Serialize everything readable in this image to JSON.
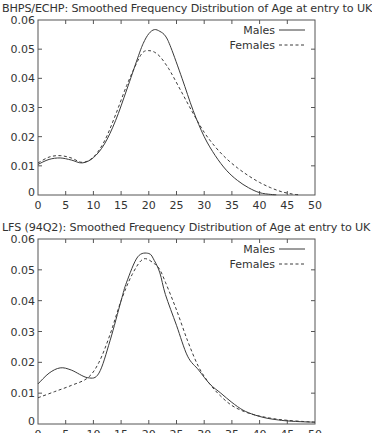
{
  "chart_data": [
    {
      "type": "line",
      "title": "BHPS/ECHP: Smoothed Frequency Distribution of Age at entry to UK",
      "xlabel": "",
      "ylabel": "",
      "xlim": [
        0,
        50
      ],
      "ylim": [
        0,
        0.06
      ],
      "xticks": [
        "0",
        "5",
        "10",
        "15",
        "20",
        "25",
        "30",
        "35",
        "40",
        "45",
        "50"
      ],
      "yticks": [
        "0",
        "0.01",
        "0.02",
        "0.03",
        "0.04",
        "0.05",
        "0.06"
      ],
      "grid": false,
      "legend_position": "upper right",
      "series": [
        {
          "name": "Males",
          "style": "solid",
          "x": [
            0,
            2,
            4,
            6,
            8,
            10,
            12,
            14,
            16,
            18,
            19,
            20,
            21,
            22,
            23,
            24,
            26,
            28,
            30,
            32,
            34,
            36,
            38,
            40,
            42,
            43
          ],
          "y": [
            0.0105,
            0.0122,
            0.0127,
            0.012,
            0.011,
            0.0128,
            0.0175,
            0.0255,
            0.036,
            0.047,
            0.052,
            0.0553,
            0.0567,
            0.0561,
            0.0545,
            0.0505,
            0.04,
            0.029,
            0.02,
            0.0135,
            0.0085,
            0.005,
            0.0025,
            0.0008,
            0.0002,
            0.0001
          ]
        },
        {
          "name": "Females",
          "style": "dashed",
          "x": [
            0,
            2,
            4,
            6,
            8,
            10,
            12,
            14,
            16,
            18,
            19,
            20,
            21,
            22,
            23,
            24,
            26,
            28,
            30,
            32,
            34,
            36,
            38,
            40,
            42,
            44,
            46,
            47
          ],
          "y": [
            0.011,
            0.013,
            0.0135,
            0.0127,
            0.0112,
            0.013,
            0.0185,
            0.0275,
            0.0375,
            0.046,
            0.049,
            0.0495,
            0.049,
            0.0475,
            0.045,
            0.042,
            0.035,
            0.028,
            0.0215,
            0.0165,
            0.0125,
            0.0093,
            0.0066,
            0.0043,
            0.0025,
            0.0011,
            0.0003,
            0.0001
          ]
        }
      ]
    },
    {
      "type": "line",
      "title": "LFS (94Q2): Smoothed Frequency Distribution of Age at entry to UK",
      "xlabel": "",
      "ylabel": "",
      "xlim": [
        0,
        50
      ],
      "ylim": [
        0,
        0.06
      ],
      "xticks": [
        "0",
        "5",
        "10",
        "15",
        "20",
        "25",
        "30",
        "35",
        "40",
        "45",
        "50"
      ],
      "yticks": [
        "0",
        "0.01",
        "0.02",
        "0.03",
        "0.04",
        "0.05",
        "0.06"
      ],
      "grid": false,
      "legend_position": "upper right",
      "series": [
        {
          "name": "Males",
          "style": "solid",
          "x": [
            0,
            2,
            4,
            6,
            9,
            11,
            13,
            15,
            16,
            18,
            20,
            21,
            22,
            23,
            25,
            27,
            29,
            31,
            33,
            35,
            37,
            39,
            41,
            43,
            45,
            48,
            50
          ],
          "y": [
            0.013,
            0.0165,
            0.0182,
            0.0175,
            0.015,
            0.0165,
            0.027,
            0.04,
            0.046,
            0.0542,
            0.0553,
            0.053,
            0.049,
            0.042,
            0.032,
            0.022,
            0.0175,
            0.013,
            0.01,
            0.007,
            0.0045,
            0.003,
            0.002,
            0.0014,
            0.001,
            0.0007,
            0.0006
          ]
        },
        {
          "name": "Females",
          "style": "dashed",
          "x": [
            0,
            3,
            6,
            9,
            11,
            13,
            15,
            17,
            19,
            21,
            22,
            23,
            25,
            27,
            29,
            31,
            33,
            35,
            37,
            39,
            41,
            43,
            45,
            48,
            50
          ],
          "y": [
            0.0085,
            0.0105,
            0.0125,
            0.015,
            0.02,
            0.029,
            0.04,
            0.0485,
            0.0535,
            0.052,
            0.05,
            0.046,
            0.037,
            0.027,
            0.0185,
            0.013,
            0.009,
            0.006,
            0.0042,
            0.003,
            0.0022,
            0.0016,
            0.0012,
            0.0008,
            0.0006
          ]
        }
      ]
    }
  ],
  "panels": [
    {
      "title": "BHPS/ECHP: Smoothed Frequency Distribution of Age at entry to UK",
      "legend": {
        "males": "Males",
        "females": "Females"
      }
    },
    {
      "title": "LFS (94Q2): Smoothed Frequency Distribution of Age at entry to UK",
      "legend": {
        "males": "Males",
        "females": "Females"
      }
    }
  ],
  "colors": {
    "axis": "#555555",
    "line": "#3a3a3a",
    "text": "#333333"
  }
}
